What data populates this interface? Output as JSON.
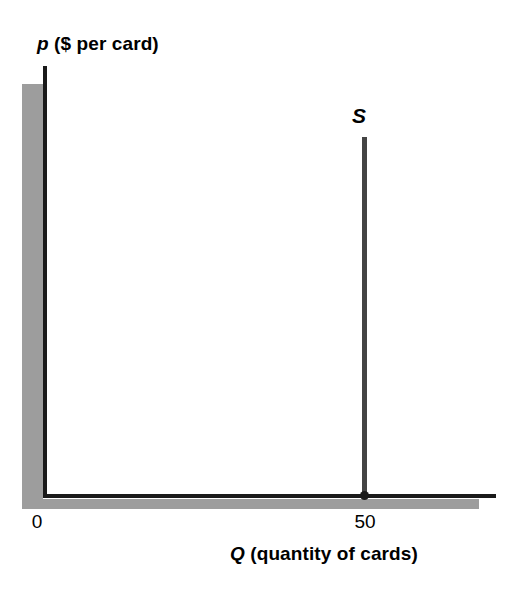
{
  "figure": {
    "background_color": "#ffffff",
    "axis_color": "#1a1a1a",
    "axis_shadow_color": "#9d9d9d",
    "curve_color": "#444444"
  },
  "axes": {
    "y": {
      "symbol": "p",
      "title_rest": " ($ per card)",
      "full_title": "p ($ per card)"
    },
    "x": {
      "symbol": "Q",
      "title_rest": " (quantity of cards)",
      "full_title": "Q (quantity of cards)"
    },
    "origin_label": "0",
    "x_tick_label": "50"
  },
  "curve": {
    "label": "S",
    "name": "supply"
  },
  "chart_data": {
    "type": "line",
    "title": "",
    "subtitle": "",
    "xlabel": "Q (quantity of cards)",
    "ylabel": "p ($ per card)",
    "grid": false,
    "legend": false,
    "xlim": [
      0,
      57
    ],
    "ylim": [
      0,
      100
    ],
    "xticks": [
      0,
      50
    ],
    "xticklabels": [
      "0",
      "50"
    ],
    "yticks": [],
    "yticklabels": [],
    "series": [
      {
        "name": "S",
        "description": "Perfectly inelastic (vertical) supply curve at quantity 50",
        "type": "vertical-line",
        "x": [
          50,
          50
        ],
        "y": [
          0,
          80
        ],
        "label": "S",
        "label_x": 50,
        "label_y": 88,
        "color": "#444444"
      }
    ],
    "annotations": [
      {
        "text": "S",
        "x": 50,
        "y": 88,
        "style": "bold-italic"
      },
      {
        "type": "point",
        "x": 50,
        "y": 0,
        "marker": "filled-circle",
        "description": "Supply curve intercepts the quantity axis at Q = 50"
      }
    ]
  }
}
